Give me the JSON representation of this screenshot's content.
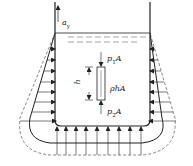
{
  "diagram": {
    "labels": {
      "acceleration": "a",
      "acceleration_sub": "y",
      "top_force": "p",
      "top_force_sub": "1",
      "top_force_suffix": "A",
      "height": "h",
      "weight": "ρhA",
      "bottom_force": "p",
      "bottom_force_sub": "2",
      "bottom_force_suffix": "A"
    },
    "colors": {
      "line": "#222222",
      "dashed": "#555555",
      "background": "#ffffff"
    }
  }
}
